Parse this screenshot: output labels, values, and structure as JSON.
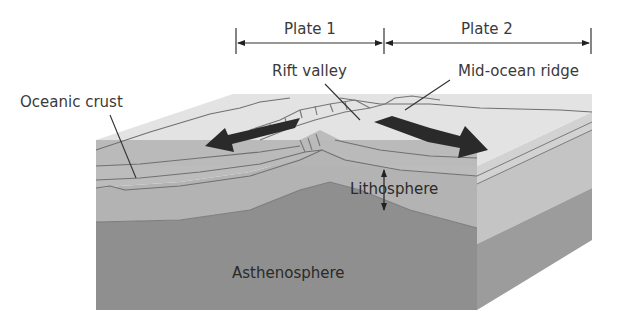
{
  "diagram": {
    "labels": {
      "plate1": "Plate 1",
      "plate2": "Plate 2",
      "rift_valley": "Rift valley",
      "mid_ocean_ridge": "Mid-ocean ridge",
      "oceanic_crust": "Oceanic crust",
      "lithosphere": "Lithosphere",
      "asthenosphere": "Asthenosphere"
    },
    "colors": {
      "top_surface": "#e4e4e4",
      "crust_front": "#bdbdbd",
      "lithosphere_front": "#b0b0b0",
      "asthenosphere": "#8e8e8e",
      "side_light": "#c8c8c8",
      "side_dark": "#9a9a9a",
      "arrow": "#2b2b2b",
      "line": "#6e6e6e"
    },
    "arrows": [
      {
        "name": "plate1-motion",
        "direction": "left"
      },
      {
        "name": "plate2-motion",
        "direction": "right"
      }
    ]
  }
}
